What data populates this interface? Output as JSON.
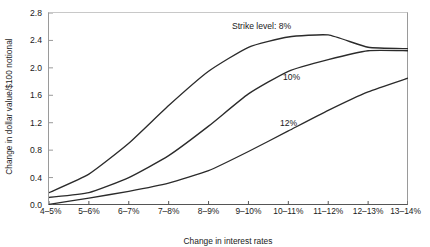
{
  "chart_data": {
    "type": "line",
    "title": "",
    "xlabel": "Change in interest rates",
    "ylabel": "Change in dollar value/$100 notional",
    "categories": [
      "4–5%",
      "5–6%",
      "6–7%",
      "7–8%",
      "8–9%",
      "9–10%",
      "10–11%",
      "11–12%",
      "12–13%",
      "13–14%"
    ],
    "ylim": [
      0.0,
      2.8
    ],
    "yticks": [
      "0.0",
      "0.4",
      "0.8",
      "1.2",
      "1.6",
      "2.0",
      "2.4",
      "2.8"
    ],
    "ytick_values": [
      0.0,
      0.4,
      0.8,
      1.2,
      1.6,
      2.0,
      2.4,
      2.8
    ],
    "grid": false,
    "legend_position": "inline-annotations",
    "series": [
      {
        "name": "8%",
        "annotation": "Strike level: 8%",
        "color": "#2b2b2b",
        "values": [
          0.18,
          0.45,
          0.9,
          1.45,
          1.95,
          2.3,
          2.45,
          2.48,
          2.3,
          2.28
        ]
      },
      {
        "name": "10%",
        "annotation": "10%",
        "color": "#2b2b2b",
        "values": [
          0.11,
          0.18,
          0.4,
          0.72,
          1.15,
          1.62,
          1.95,
          2.12,
          2.25,
          2.25
        ]
      },
      {
        "name": "12%",
        "annotation": "12%",
        "color": "#2b2b2b",
        "values": [
          0.01,
          0.1,
          0.2,
          0.32,
          0.5,
          0.78,
          1.08,
          1.38,
          1.65,
          1.85
        ]
      }
    ],
    "annotations": [
      {
        "text": "Strike level: 8%",
        "x_px": 232,
        "y_px": 22,
        "series": "8%"
      },
      {
        "text": "10%",
        "x_px": 283,
        "y_px": 73,
        "series": "10%"
      },
      {
        "text": "12%",
        "x_px": 280,
        "y_px": 119,
        "series": "12%"
      }
    ]
  }
}
